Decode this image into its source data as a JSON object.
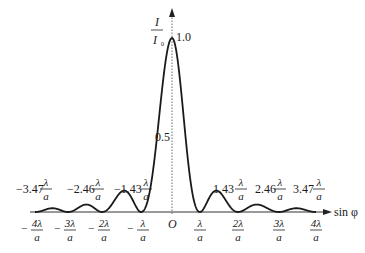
{
  "chart_data": {
    "type": "line",
    "ylabel": {
      "numerator": "I",
      "denominator": "I",
      "denominator_sub": "0"
    },
    "xlabel": "sin φ",
    "origin_label": "O",
    "y_ticks": [
      {
        "value": 0.5,
        "label": "0.5"
      },
      {
        "value": 1.0,
        "label": "1.0"
      }
    ],
    "minima": [
      {
        "sign": "−",
        "num": "4λ",
        "den": "a",
        "value": -4
      },
      {
        "sign": "−",
        "num": "3λ",
        "den": "a",
        "value": -3
      },
      {
        "sign": "−",
        "num": "2λ",
        "den": "a",
        "value": -2
      },
      {
        "sign": "−",
        "num": "λ",
        "den": "a",
        "value": -1
      },
      {
        "sign": "",
        "num": "λ",
        "den": "a",
        "value": 1
      },
      {
        "sign": "",
        "num": "2λ",
        "den": "a",
        "value": 2
      },
      {
        "sign": "",
        "num": "3λ",
        "den": "a",
        "value": 3
      },
      {
        "sign": "",
        "num": "4λ",
        "den": "a",
        "value": 4
      }
    ],
    "secondary_maxima": [
      {
        "coef": "−3.47",
        "num": "λ",
        "den": "a",
        "value": -3.47
      },
      {
        "coef": "−2.46",
        "num": "λ",
        "den": "a",
        "value": -2.46
      },
      {
        "coef": "−1.43",
        "num": "λ",
        "den": "a",
        "value": -1.43
      },
      {
        "coef": "1.43",
        "num": "λ",
        "den": "a",
        "value": 1.43
      },
      {
        "coef": "2.46",
        "num": "λ",
        "den": "a",
        "value": 2.46
      },
      {
        "coef": "3.47",
        "num": "λ",
        "den": "a",
        "value": 3.47
      }
    ],
    "series": [
      {
        "name": "I/I0",
        "function": "(sin(πx)/(πx))^2",
        "x_range": [
          -4,
          4
        ]
      }
    ],
    "peak": {
      "x": 0,
      "y": 1.0
    }
  }
}
